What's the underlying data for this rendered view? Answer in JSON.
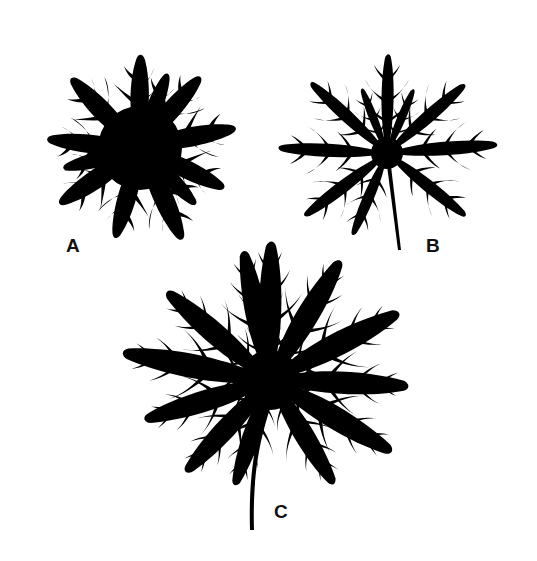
{
  "figure": {
    "background": "#ffffff",
    "ink_color": "#000000",
    "leaves": [
      {
        "id": "A",
        "label": "A",
        "description": "densely dissected palmate leaf, no visible petiole"
      },
      {
        "id": "B",
        "label": "B",
        "description": "palmately dissected leaf with slender petiole"
      },
      {
        "id": "C",
        "label": "C",
        "description": "large palmately dissected leaf with long curved petiole"
      }
    ]
  }
}
